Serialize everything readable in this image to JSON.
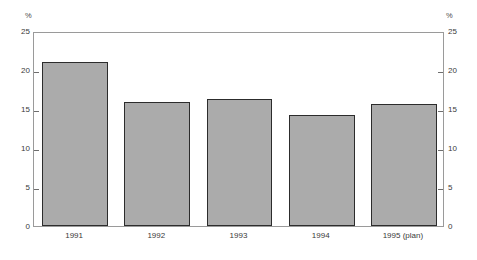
{
  "chart_data": {
    "type": "bar",
    "title": "",
    "xlabel": "",
    "ylabel": "%",
    "ylabel_right": "%",
    "ylim": [
      0,
      25
    ],
    "yticks": [
      0,
      5,
      10,
      15,
      20,
      25
    ],
    "ytick_labels": [
      "0",
      "5",
      "10",
      "15",
      "20",
      "25"
    ],
    "ytick_labels_right": [
      "0",
      "5",
      "10",
      "15",
      "20",
      "25"
    ],
    "grid": false,
    "legend": false,
    "categories": [
      "1991",
      "1992",
      "1993",
      "1994",
      "1995 (plan)"
    ],
    "values": [
      21.0,
      15.9,
      16.3,
      14.2,
      15.6
    ],
    "series": [
      {
        "name": "",
        "values": [
          21.0,
          15.9,
          16.3,
          14.2,
          15.6
        ]
      }
    ],
    "colors": {
      "bar_fill": "#ababab",
      "bar_border": "#2c2c2c",
      "frame": "#9a9a9a",
      "tick": "#6e6e6e",
      "text": "#3a3a3a",
      "background": "#ffffff"
    }
  }
}
